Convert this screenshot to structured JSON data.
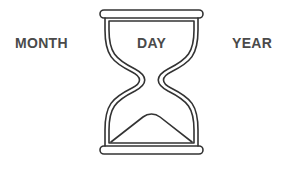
{
  "labels": {
    "left": "MONTH",
    "center": "DAY",
    "right": "YEAR"
  },
  "icon": {
    "name": "hourglass-icon",
    "stroke_color": "#333333"
  },
  "colors": {
    "text": "#4a4a4a",
    "background": "#ffffff"
  }
}
